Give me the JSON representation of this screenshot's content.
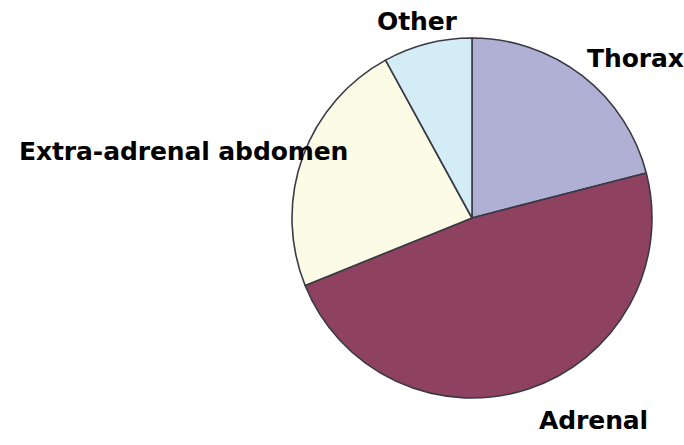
{
  "chart_data": {
    "type": "pie",
    "title": "",
    "subtitle": "",
    "xlabel": "",
    "ylabel": "",
    "legend_position": "none",
    "grid": false,
    "labels_shown_on_slices": false,
    "labels_shown_outside": true,
    "center_x": 472,
    "center_y": 218,
    "radius": 180,
    "start_angle_deg": 0,
    "direction": "clockwise",
    "categories": [
      "Thorax",
      "Adrenal",
      "Extra-adrenal abdomen",
      "Other"
    ],
    "values": [
      21,
      48,
      23,
      8
    ],
    "slices": [
      {
        "label": "Thorax",
        "value": 21,
        "percent": "21%",
        "start_angle_deg": 0,
        "end_angle_deg": 75.5,
        "color": "#b0b0d4",
        "edge_color": "#3a3a46",
        "label_position": "right-top"
      },
      {
        "label": "Adrenal",
        "value": 48,
        "percent": "48%",
        "start_angle_deg": 75.5,
        "end_angle_deg": 248.0,
        "color": "#8e4260",
        "edge_color": "#3a3a46",
        "label_position": "bottom-right"
      },
      {
        "label": "Extra-adrenal abdomen",
        "value": 23,
        "percent": "23%",
        "start_angle_deg": 248.0,
        "end_angle_deg": 331.3,
        "color": "#fbfbe6",
        "edge_color": "#3a3a46",
        "label_position": "left"
      },
      {
        "label": "Other",
        "value": 8,
        "percent": "8%",
        "start_angle_deg": 331.3,
        "end_angle_deg": 360,
        "color": "#d4ecf5",
        "edge_color": "#3a3a46",
        "label_position": "top"
      }
    ],
    "background_color": "#ffffff",
    "label_text_color": "#000000"
  },
  "labels": {
    "other": "Other",
    "thorax": "Thorax",
    "extra_adrenal_abdomen": "Extra-adrenal abdomen",
    "adrenal": "Adrenal"
  }
}
